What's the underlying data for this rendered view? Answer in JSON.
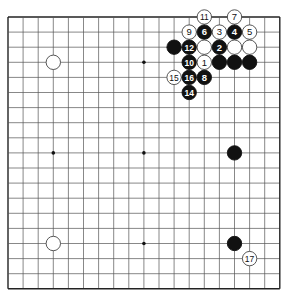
{
  "board": {
    "size": 19,
    "origin_x": 8,
    "origin_y": 17,
    "spacing": 15.1,
    "line_color": "#555555",
    "border_color": "#222222",
    "star_points": [
      [
        3,
        3
      ],
      [
        9,
        3
      ],
      [
        15,
        3
      ],
      [
        3,
        9
      ],
      [
        9,
        9
      ],
      [
        15,
        9
      ],
      [
        3,
        15
      ],
      [
        9,
        15
      ],
      [
        15,
        15
      ]
    ],
    "visible_star_points": [
      [
        9,
        3
      ],
      [
        3,
        9
      ],
      [
        9,
        9
      ],
      [
        9,
        15
      ]
    ]
  },
  "stones": [
    {
      "col": 13,
      "row": 0,
      "color": "white",
      "label": "11"
    },
    {
      "col": 15,
      "row": 0,
      "color": "white",
      "label": "7"
    },
    {
      "col": 12,
      "row": 1,
      "color": "white",
      "label": "9"
    },
    {
      "col": 13,
      "row": 1,
      "color": "black",
      "label": "6"
    },
    {
      "col": 14,
      "row": 1,
      "color": "white",
      "label": "3"
    },
    {
      "col": 15,
      "row": 1,
      "color": "black",
      "label": "4"
    },
    {
      "col": 16,
      "row": 1,
      "color": "white",
      "label": "5"
    },
    {
      "col": 11,
      "row": 2,
      "color": "black",
      "label": ""
    },
    {
      "col": 12,
      "row": 2,
      "color": "black",
      "label": "12"
    },
    {
      "col": 13,
      "row": 2,
      "color": "white",
      "label": ""
    },
    {
      "col": 14,
      "row": 2,
      "color": "black",
      "label": "2"
    },
    {
      "col": 15,
      "row": 2,
      "color": "white",
      "label": ""
    },
    {
      "col": 16,
      "row": 2,
      "color": "white",
      "label": ""
    },
    {
      "col": 3,
      "row": 3,
      "color": "white",
      "label": ""
    },
    {
      "col": 12,
      "row": 3,
      "color": "black",
      "label": "10"
    },
    {
      "col": 13,
      "row": 3,
      "color": "white",
      "label": "1"
    },
    {
      "col": 14,
      "row": 3,
      "color": "black",
      "label": ""
    },
    {
      "col": 15,
      "row": 3,
      "color": "black",
      "label": ""
    },
    {
      "col": 16,
      "row": 3,
      "color": "black",
      "label": ""
    },
    {
      "col": 11,
      "row": 4,
      "color": "white",
      "label": "15"
    },
    {
      "col": 12,
      "row": 4,
      "color": "black",
      "label": "16"
    },
    {
      "col": 13,
      "row": 4,
      "color": "black",
      "label": "8"
    },
    {
      "col": 12,
      "row": 5,
      "color": "black",
      "label": "14"
    },
    {
      "col": 15,
      "row": 9,
      "color": "black",
      "label": ""
    },
    {
      "col": 3,
      "row": 15,
      "color": "white",
      "label": ""
    },
    {
      "col": 15,
      "row": 15,
      "color": "black",
      "label": ""
    },
    {
      "col": 16,
      "row": 16,
      "color": "white",
      "label": "17"
    }
  ]
}
